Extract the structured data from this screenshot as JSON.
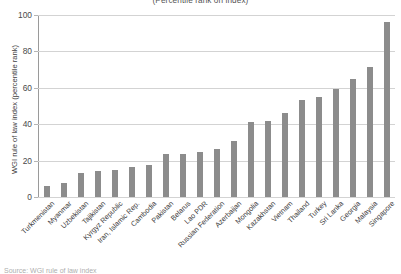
{
  "chart_data": {
    "type": "bar",
    "title": "(Percentile rank on index)",
    "xlabel": "",
    "ylabel": "WGI rule of law index (percentile rank)",
    "ylim": [
      0,
      100
    ],
    "yticks": [
      0,
      20,
      40,
      60,
      80,
      100
    ],
    "grid": true,
    "legend": null,
    "bar_color": "#8c8c8c",
    "categories": [
      "Turkmenistan",
      "Myanmar",
      "Uzbekistan",
      "Tajikistan",
      "Kyrgyz Republic",
      "Iran, Islamic Rep.",
      "Cambodia",
      "Pakistan",
      "Belarus",
      "Lao PDR",
      "Russian Federation",
      "Azerbaijan",
      "Mongolia",
      "Kazakhstan",
      "Vietnam",
      "Thailand",
      "Turkey",
      "Sri Lanka",
      "Georgia",
      "Malaysia",
      "Singapore"
    ],
    "values": [
      6,
      7.5,
      13,
      14.5,
      15,
      16.5,
      17.5,
      23.5,
      23.5,
      25,
      26.5,
      31,
      41,
      41.5,
      46,
      53.5,
      55,
      59.5,
      65,
      71.5,
      96
    ]
  },
  "caption": "Source: WGI rule of law index"
}
